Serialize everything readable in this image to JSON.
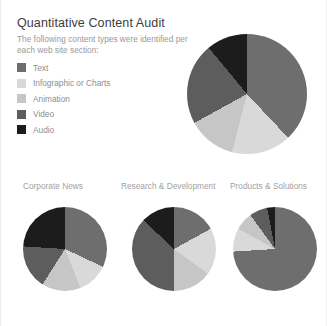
{
  "header": {
    "title": "Quantitative Content Audit",
    "subtitle": "The following content types were identified per each web site section:"
  },
  "legend": {
    "items": [
      {
        "label": "Text",
        "color": "#6e6e6e"
      },
      {
        "label": "Infographic or Charts",
        "color": "#d9d9d9"
      },
      {
        "label": "Animation",
        "color": "#c6c6c6"
      },
      {
        "label": "Video",
        "color": "#5d5d5d"
      },
      {
        "label": "Audio",
        "color": "#1c1c1c"
      }
    ]
  },
  "colors": {
    "text": "#6e6e6e",
    "infographic": "#d9d9d9",
    "animation": "#c6c6c6",
    "video": "#5d5d5d",
    "audio": "#1c1c1c",
    "title": "#3d3d3d",
    "body": "#9a9a9a",
    "background": "#ffffff"
  },
  "chart_data": [
    {
      "type": "pie",
      "title": "",
      "name": "overall-audit",
      "categories": [
        "Text",
        "Infographic or Charts",
        "Animation",
        "Video",
        "Audio"
      ],
      "values": [
        38,
        16,
        13,
        22,
        11
      ],
      "colors": [
        "#6e6e6e",
        "#d9d9d9",
        "#c6c6c6",
        "#5d5d5d",
        "#1c1c1c"
      ],
      "start_angle": 0,
      "legend": "left",
      "grid": false
    },
    {
      "type": "pie",
      "title": "Corporate News",
      "name": "corporate-news",
      "categories": [
        "Text",
        "Infographic or Charts",
        "Animation",
        "Video",
        "Audio"
      ],
      "values": [
        32,
        12,
        15,
        17,
        24
      ],
      "colors": [
        "#6e6e6e",
        "#d9d9d9",
        "#c6c6c6",
        "#5d5d5d",
        "#1c1c1c"
      ],
      "start_angle": 0,
      "legend": "none",
      "grid": false
    },
    {
      "type": "pie",
      "title": "Research & Development",
      "name": "research-development",
      "categories": [
        "Text",
        "Infographic or Charts",
        "Animation",
        "Video",
        "Audio"
      ],
      "values": [
        17,
        18,
        15,
        37,
        13
      ],
      "colors": [
        "#6e6e6e",
        "#d9d9d9",
        "#c6c6c6",
        "#5d5d5d",
        "#1c1c1c"
      ],
      "start_angle": 0,
      "legend": "none",
      "grid": false
    },
    {
      "type": "pie",
      "title": "Products & Solutions",
      "name": "products-solutions",
      "categories": [
        "Text",
        "Infographic or Charts",
        "Animation",
        "Video",
        "Audio"
      ],
      "values": [
        74,
        9,
        7,
        7,
        3
      ],
      "colors": [
        "#6e6e6e",
        "#d9d9d9",
        "#c6c6c6",
        "#5d5d5d",
        "#1c1c1c"
      ],
      "start_angle": 0,
      "legend": "none",
      "grid": false
    }
  ]
}
